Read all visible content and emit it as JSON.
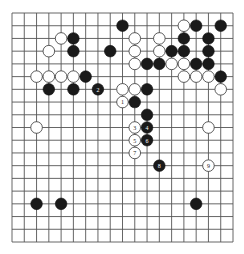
{
  "board": {
    "size": 19,
    "colors": {
      "background": "#ffffff",
      "line": "#555555",
      "black": "#1a1a1a",
      "white": "#ffffff"
    },
    "stones": [
      {
        "color": "black",
        "col": 9,
        "row": 1
      },
      {
        "color": "white",
        "col": 14,
        "row": 1
      },
      {
        "color": "black",
        "col": 15,
        "row": 1
      },
      {
        "color": "black",
        "col": 17,
        "row": 1
      },
      {
        "color": "white",
        "col": 4,
        "row": 2
      },
      {
        "color": "black",
        "col": 5,
        "row": 2
      },
      {
        "color": "white",
        "col": 10,
        "row": 2
      },
      {
        "color": "white",
        "col": 12,
        "row": 2
      },
      {
        "color": "black",
        "col": 14,
        "row": 2
      },
      {
        "color": "black",
        "col": 16,
        "row": 2
      },
      {
        "color": "white",
        "col": 3,
        "row": 3
      },
      {
        "color": "black",
        "col": 5,
        "row": 3
      },
      {
        "color": "black",
        "col": 8,
        "row": 3
      },
      {
        "color": "white",
        "col": 10,
        "row": 3
      },
      {
        "color": "white",
        "col": 12,
        "row": 3
      },
      {
        "color": "black",
        "col": 13,
        "row": 3
      },
      {
        "color": "black",
        "col": 14,
        "row": 3
      },
      {
        "color": "black",
        "col": 16,
        "row": 3
      },
      {
        "color": "white",
        "col": 10,
        "row": 4
      },
      {
        "color": "black",
        "col": 11,
        "row": 4
      },
      {
        "color": "black",
        "col": 12,
        "row": 4
      },
      {
        "color": "white",
        "col": 13,
        "row": 4
      },
      {
        "color": "white",
        "col": 14,
        "row": 4
      },
      {
        "color": "black",
        "col": 15,
        "row": 4
      },
      {
        "color": "black",
        "col": 16,
        "row": 4
      },
      {
        "color": "white",
        "col": 2,
        "row": 5
      },
      {
        "color": "white",
        "col": 3,
        "row": 5
      },
      {
        "color": "white",
        "col": 4,
        "row": 5
      },
      {
        "color": "white",
        "col": 5,
        "row": 5
      },
      {
        "color": "black",
        "col": 6,
        "row": 5
      },
      {
        "color": "white",
        "col": 14,
        "row": 5
      },
      {
        "color": "white",
        "col": 15,
        "row": 5
      },
      {
        "color": "white",
        "col": 16,
        "row": 5
      },
      {
        "color": "black",
        "col": 17,
        "row": 5
      },
      {
        "color": "black",
        "col": 3,
        "row": 6
      },
      {
        "color": "black",
        "col": 5,
        "row": 6
      },
      {
        "color": "black",
        "col": 7,
        "row": 6,
        "label": "2"
      },
      {
        "color": "white",
        "col": 9,
        "row": 6
      },
      {
        "color": "white",
        "col": 10,
        "row": 6
      },
      {
        "color": "black",
        "col": 11,
        "row": 6
      },
      {
        "color": "white",
        "col": 17,
        "row": 6
      },
      {
        "color": "white",
        "col": 9,
        "row": 7,
        "label": "1"
      },
      {
        "color": "black",
        "col": 10,
        "row": 7
      },
      {
        "color": "black",
        "col": 11,
        "row": 8
      },
      {
        "color": "white",
        "col": 2,
        "row": 9
      },
      {
        "color": "white",
        "col": 10,
        "row": 9,
        "label": "3"
      },
      {
        "color": "black",
        "col": 11,
        "row": 9,
        "label": "4"
      },
      {
        "color": "white",
        "col": 16,
        "row": 9
      },
      {
        "color": "white",
        "col": 10,
        "row": 10,
        "label": "5"
      },
      {
        "color": "black",
        "col": 11,
        "row": 10,
        "label": "6"
      },
      {
        "color": "white",
        "col": 10,
        "row": 11,
        "label": "7"
      },
      {
        "color": "black",
        "col": 12,
        "row": 12,
        "label": "8"
      },
      {
        "color": "white",
        "col": 16,
        "row": 12,
        "label": "9"
      },
      {
        "color": "black",
        "col": 2,
        "row": 15
      },
      {
        "color": "black",
        "col": 4,
        "row": 15
      },
      {
        "color": "black",
        "col": 15,
        "row": 15
      }
    ]
  }
}
